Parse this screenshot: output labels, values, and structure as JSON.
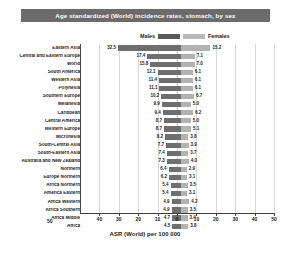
{
  "header": {
    "title": "Age standardized (World) incidence rates, stomach, by sex"
  },
  "legend": {
    "male_label": "Males",
    "female_label": "Females",
    "male_color": "#6e6e6e",
    "female_color": "#b2b2b2"
  },
  "axis": {
    "title": "ASR (World) per 100 000",
    "origin_label": "50",
    "ticks": [
      "40",
      "30",
      "20",
      "10",
      "0",
      "10",
      "20",
      "30",
      "40",
      "50"
    ]
  },
  "chart_data": {
    "type": "bar",
    "orientation": "horizontal-diverging",
    "title": "Age standardized (World) incidence rates, stomach, by sex",
    "xlabel": "ASR (World) per 100 000",
    "ylabel": "",
    "xlim": [
      50,
      50
    ],
    "xticks": [
      40,
      30,
      20,
      10,
      0,
      10,
      20,
      30,
      40,
      50
    ],
    "grid": true,
    "legend_position": "top",
    "categories": [
      "Eastern Asia",
      "Central and Eastern Europe",
      "World",
      "South America",
      "Western Asia",
      "Polynesia",
      "Southern Europe",
      "Melanesia",
      "Caribbean",
      "Central America",
      "Western Europe",
      "Micronesia",
      "South-Central Asia",
      "South-Eastern Asia",
      "Australia and New Zealand",
      "Northern",
      "Europe Northern",
      "Africa Northern",
      "America Eastern",
      "Africa Western",
      "Africa Southern",
      "Africa Middle",
      "Africa"
    ],
    "series": [
      {
        "name": "Males",
        "values": [
          32.5,
          17.4,
          15.8,
          12.1,
          11.4,
          11.1,
          10.2,
          9.9,
          9.4,
          8.7,
          8.7,
          8.2,
          7.7,
          7.4,
          7.3,
          6.4,
          6.2,
          5.4,
          5.4,
          4.9,
          4.9,
          4.7,
          4.5
        ]
      },
      {
        "name": "Females",
        "values": [
          15.2,
          7.1,
          7.0,
          6.1,
          6.1,
          6.1,
          6.7,
          5.0,
          6.2,
          5.0,
          5.1,
          3.8,
          3.9,
          3.7,
          4.0,
          2.9,
          3.1,
          3.5,
          3.1,
          4.2,
          3.5,
          3.4,
          3.8
        ]
      }
    ]
  }
}
